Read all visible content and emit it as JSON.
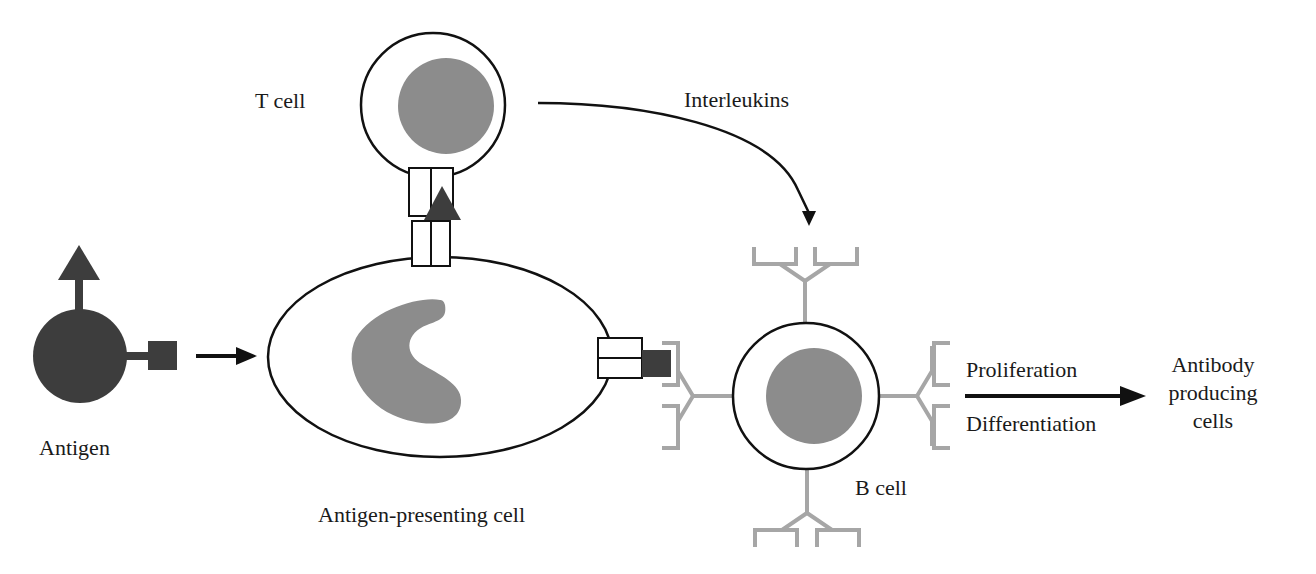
{
  "diagram": {
    "type": "immune-response-pathway",
    "labels": {
      "antigen": "Antigen",
      "apc": "Antigen-presenting cell",
      "t_cell": "T cell",
      "interleukins": "Interleukins",
      "b_cell": "B cell",
      "proliferation": "Proliferation",
      "differentiation": "Differentiation",
      "output_line1": "Antibody",
      "output_line2": "producing",
      "output_line3": "cells"
    },
    "nodes": [
      {
        "id": "antigen",
        "label": "Antigen",
        "shape": "dark circle with triangle and square epitopes"
      },
      {
        "id": "apc",
        "label": "Antigen-presenting cell",
        "shape": "ellipse with kidney-shaped nucleus"
      },
      {
        "id": "t_cell",
        "label": "T cell",
        "shape": "circle with round nucleus"
      },
      {
        "id": "b_cell",
        "label": "B cell",
        "shape": "circle with round nucleus and four Y-shaped antibodies"
      },
      {
        "id": "antibody_cells",
        "label": "Antibody producing cells",
        "shape": "text"
      }
    ],
    "edges": [
      {
        "from": "antigen",
        "to": "apc",
        "style": "straight arrow"
      },
      {
        "from": "t_cell",
        "to": "b_cell",
        "label": "Interleukins",
        "style": "curved arrow"
      },
      {
        "from": "b_cell",
        "to": "antibody_cells",
        "label_above": "Proliferation",
        "label_below": "Differentiation",
        "style": "straight arrow"
      }
    ],
    "colors": {
      "antigen_dark": "#3d3d3d",
      "nucleus_gray": "#8c8c8c",
      "antibody_gray": "#a6a6a6",
      "outline": "#111111",
      "text": "#1a1a1a",
      "background": "#ffffff"
    }
  }
}
